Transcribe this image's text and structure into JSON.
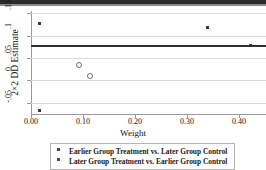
{
  "chart_data": {
    "type": "scatter",
    "title": "",
    "xlabel": "Weight",
    "ylabel": "2×2 DD Estimate",
    "xlim": [
      0.0,
      0.452
    ],
    "ylim": [
      -0.075,
      0.155
    ],
    "xticks": [
      "0.00",
      "0.10",
      "0.20",
      "0.30",
      "0.40"
    ],
    "xtickvalues": [
      0.0,
      0.1,
      0.2,
      0.3,
      0.4
    ],
    "yticks": [
      "-.05",
      "0",
      ".05",
      ".1",
      ".15"
    ],
    "ytickvalues": [
      -0.05,
      0.0,
      0.05,
      0.1,
      0.15
    ],
    "grid": true,
    "legend_position": "below-axis",
    "reference_line": {
      "value": 0.0785,
      "orientation": "horizontal",
      "color": "#2e2e2e"
    },
    "series": [
      {
        "name": "Earlier Group Treatment vs. Later Group Control",
        "marker": "open-circle",
        "points": [
          {
            "x": 0.092,
            "y": 0.0355
          },
          {
            "x": 0.114,
            "y": 0.0105
          }
        ]
      },
      {
        "name": "Later Group Treatment vs. Earlier Group Control",
        "marker": "filled-square",
        "points": [
          {
            "x": 0.016,
            "y": 0.1265
          },
          {
            "x": 0.017,
            "y": -0.068
          },
          {
            "x": 0.34,
            "y": 0.1175
          },
          {
            "x": 0.422,
            "y": 0.078
          }
        ]
      }
    ]
  },
  "legend": {
    "entries": [
      {
        "label": "Earlier Group Treatment vs. Later Group Control",
        "marker": "open-square-marker"
      },
      {
        "label": "Later Group Treatment vs. Earlier Group Control",
        "marker": "filled-square-marker"
      }
    ]
  }
}
